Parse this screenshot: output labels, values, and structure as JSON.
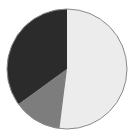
{
  "chart_data": {
    "type": "pie",
    "title": "",
    "categories": [
      "Slice A",
      "Slice B",
      "Slice C"
    ],
    "values": [
      52,
      13,
      35
    ],
    "colors": [
      "#ececec",
      "#7d7d7d",
      "#2b2b2b"
    ],
    "start_angle_deg": 0,
    "direction": "clockwise",
    "legend": "none",
    "labels_visible": false
  },
  "style": {
    "outline_color": "#8a8a8a",
    "center": [
      67,
      69
    ],
    "radius": 60
  }
}
